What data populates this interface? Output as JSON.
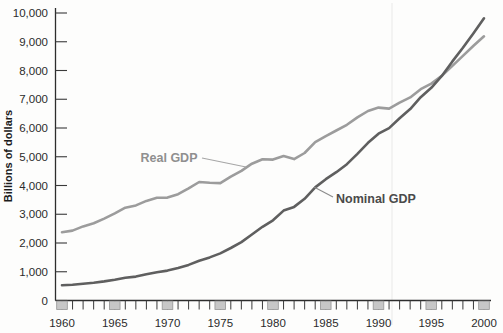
{
  "figure": {
    "background": "#fdfdfc",
    "axis_color": "#2d2d2d",
    "tick_color": "#3a3a3a",
    "tick_box_fill": "#c7c7c7",
    "tick_box_stroke": "#949494",
    "tick_label_color": "#2b2b2b",
    "artifact_line_color": "#eeeeee",
    "y_axis_title": "Billions of dollars",
    "y_axis_title_color": "#1c1c1c"
  },
  "chart_data": {
    "type": "line",
    "title": "",
    "xlabel": "",
    "ylabel": "Billions of dollars",
    "xlim": [
      1960,
      2000
    ],
    "ylim": [
      0,
      10000
    ],
    "grid": false,
    "legend_position": "inline-annotations",
    "yticks": [
      0,
      1000,
      2000,
      3000,
      4000,
      5000,
      6000,
      7000,
      8000,
      9000,
      10000
    ],
    "ytick_labels": [
      "0",
      "1,000",
      "2,000",
      "3,000",
      "4,000",
      "5,000",
      "6,000",
      "7,000",
      "8,000",
      "9,000",
      "10,000"
    ],
    "xticks_minor_every": 1,
    "xticks_labeled": [
      1960,
      1965,
      1970,
      1975,
      1980,
      1985,
      1990,
      1995,
      2000
    ],
    "x": [
      1960,
      1961,
      1962,
      1963,
      1964,
      1965,
      1966,
      1967,
      1968,
      1969,
      1970,
      1971,
      1972,
      1973,
      1974,
      1975,
      1976,
      1977,
      1978,
      1979,
      1980,
      1981,
      1982,
      1983,
      1984,
      1985,
      1986,
      1987,
      1988,
      1989,
      1990,
      1991,
      1992,
      1993,
      1994,
      1995,
      1996,
      1997,
      1998,
      1999,
      2000
    ],
    "series": [
      {
        "name": "Real GDP",
        "color": "#9c9c9c",
        "label_color": "#8f8f8f",
        "leader_color": "#a6a6a6",
        "values": [
          2377,
          2432,
          2578,
          2690,
          2847,
          3028,
          3227,
          3308,
          3466,
          3571,
          3578,
          3697,
          3898,
          4123,
          4099,
          4084,
          4311,
          4511,
          4760,
          4912,
          4901,
          5021,
          4919,
          5132,
          5505,
          5717,
          5912,
          6113,
          6368,
          6592,
          6708,
          6676,
          6880,
          7063,
          7348,
          7544,
          7813,
          8160,
          8509,
          8859,
          9191
        ]
      },
      {
        "name": "Nominal GDP",
        "color": "#5f5f5f",
        "label_color": "#4a4a4a",
        "leader_color": "#8c8c8c",
        "values": [
          527,
          545,
          586,
          618,
          664,
          719,
          788,
          833,
          910,
          984,
          1039,
          1127,
          1238,
          1383,
          1500,
          1638,
          1825,
          2030,
          2294,
          2563,
          2790,
          3128,
          3255,
          3537,
          3933,
          4220,
          4463,
          4740,
          5104,
          5484,
          5803,
          5996,
          6338,
          6657,
          7072,
          7398,
          7813,
          8318,
          8790,
          9299,
          9817
        ]
      }
    ],
    "annotations": [
      {
        "label": "Real GDP",
        "series": "Real GDP",
        "anchor_year": 1977.4,
        "anchor_value": 4590
      },
      {
        "label": "Nominal GDP",
        "series": "Nominal GDP",
        "anchor_year": 1983.9,
        "anchor_value": 3900
      }
    ]
  }
}
